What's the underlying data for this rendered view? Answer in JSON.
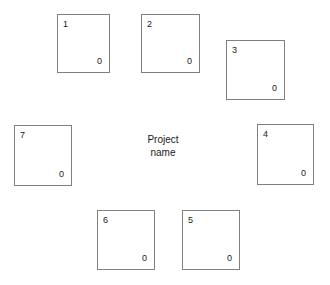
{
  "diagram": {
    "center_label": {
      "line1": "Project",
      "line2": "name"
    },
    "nodes": [
      {
        "index": "1",
        "value": "0",
        "x": 57,
        "y": 14,
        "w": 53,
        "h": 59
      },
      {
        "index": "2",
        "value": "0",
        "x": 141,
        "y": 14,
        "w": 59,
        "h": 59
      },
      {
        "index": "3",
        "value": "0",
        "x": 226,
        "y": 40,
        "w": 59,
        "h": 60
      },
      {
        "index": "4",
        "value": "0",
        "x": 257,
        "y": 124,
        "w": 57,
        "h": 61
      },
      {
        "index": "5",
        "value": "0",
        "x": 182,
        "y": 210,
        "w": 58,
        "h": 60
      },
      {
        "index": "6",
        "value": "0",
        "x": 97,
        "y": 210,
        "w": 58,
        "h": 60
      },
      {
        "index": "7",
        "value": "0",
        "x": 14,
        "y": 125,
        "w": 58,
        "h": 61
      }
    ]
  },
  "colors": {
    "background": "#ffffff",
    "box_border": "#808080",
    "text": "#1a1a1a"
  }
}
